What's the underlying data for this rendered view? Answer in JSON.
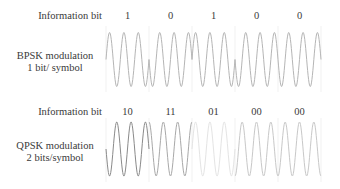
{
  "bpsk": {
    "info_label": "Information bit",
    "title_line1": "BPSK modulation",
    "title_line2": "1 bit/ symbol",
    "bits": [
      "1",
      "0",
      "1",
      "0",
      "0"
    ],
    "phases_deg": [
      0,
      180,
      0,
      180,
      180
    ],
    "wave_color": "#b5b5b5"
  },
  "qpsk": {
    "info_label": "Information bit",
    "title_line1": "QPSK modulation",
    "title_line2": "2 bits/symbol",
    "symbols": [
      "10",
      "11",
      "01",
      "00",
      "00"
    ],
    "phases_deg": [
      180,
      90,
      0,
      270,
      270
    ],
    "wave_colors": [
      "#8a8a8a",
      "#a8a8a8",
      "#e4e4e4",
      "#c8c8c8",
      "#c8c8c8"
    ]
  },
  "divider_color": "#eeeeee"
}
